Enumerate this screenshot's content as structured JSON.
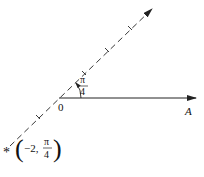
{
  "diagram": {
    "origin_label": "0",
    "polar_axis_label": "A",
    "angle_label": {
      "numerator": "π",
      "denominator": "4"
    },
    "point_marker": "*",
    "point_label": {
      "open": "(",
      "r": "−2,",
      "numerator": "π",
      "denominator": "4",
      "close": ")"
    },
    "caption": ""
  },
  "colors": {
    "stroke": "#222222",
    "background": "#ffffff"
  }
}
